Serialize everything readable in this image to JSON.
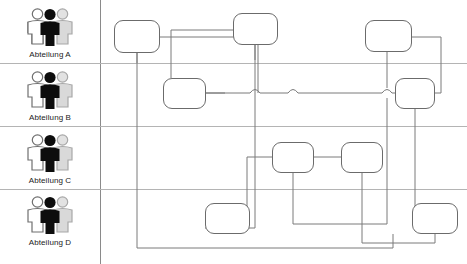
{
  "diagram": {
    "type": "swimlane-flowchart",
    "title": "",
    "canvas": {
      "width": 467,
      "height": 264,
      "background": "#ffffff"
    },
    "header_column": {
      "x": 0,
      "width": 100,
      "divider_x": 100,
      "divider_color": "#8a8a8a"
    },
    "lane_divider_color": "#b4b4b4",
    "node_stroke": "#6b6b6b",
    "node_fill": "#ffffff",
    "wire_color": "#7a7a7a",
    "lanes": [
      {
        "id": "lane-a",
        "label": "Abteilung A",
        "icon": "group-people-icon",
        "top": 0,
        "bottom": 63,
        "icon_y": 6,
        "label_y": 50
      },
      {
        "id": "lane-b",
        "label": "Abteilung B",
        "icon": "group-people-icon",
        "top": 63,
        "bottom": 126,
        "icon_y": 69,
        "label_y": 113
      },
      {
        "id": "lane-c",
        "label": "Abteilung C",
        "icon": "group-people-icon",
        "top": 126,
        "bottom": 189,
        "icon_y": 132,
        "label_y": 176
      },
      {
        "id": "lane-d",
        "label": "Abteilung D",
        "icon": "group-people-icon",
        "top": 189,
        "bottom": 264,
        "icon_y": 194,
        "label_y": 238
      }
    ],
    "lane_dividers_y": [
      63,
      126,
      189
    ],
    "nodes": [
      {
        "id": "n1",
        "lane": "lane-a",
        "label": "",
        "x": 114,
        "y": 20,
        "w": 46,
        "h": 33
      },
      {
        "id": "n2",
        "lane": "lane-a",
        "label": "",
        "x": 233,
        "y": 13,
        "w": 45,
        "h": 32
      },
      {
        "id": "n3",
        "lane": "lane-a",
        "label": "",
        "x": 365,
        "y": 20,
        "w": 47,
        "h": 32
      },
      {
        "id": "n4",
        "lane": "lane-b",
        "label": "",
        "x": 163,
        "y": 78,
        "w": 43,
        "h": 31
      },
      {
        "id": "n5",
        "lane": "lane-b",
        "label": "",
        "x": 395,
        "y": 78,
        "w": 40,
        "h": 31
      },
      {
        "id": "n6",
        "lane": "lane-c",
        "label": "",
        "x": 272,
        "y": 142,
        "w": 42,
        "h": 31
      },
      {
        "id": "n7",
        "lane": "lane-c",
        "label": "",
        "x": 341,
        "y": 142,
        "w": 42,
        "h": 31
      },
      {
        "id": "n8",
        "lane": "lane-d",
        "label": "",
        "x": 205,
        "y": 203,
        "w": 45,
        "h": 31
      },
      {
        "id": "n9",
        "lane": "lane-d",
        "label": "",
        "x": 412,
        "y": 203,
        "w": 46,
        "h": 31
      }
    ],
    "connectors": [
      {
        "id": "c1",
        "from": "n1",
        "to": "n4",
        "path": "M160,37 L258,37 L258,93 L206,93"
      },
      {
        "id": "c2",
        "from": "n1",
        "to": "n8",
        "path": "M137,53 L137,248 L393,248 L393,234"
      },
      {
        "id": "c3",
        "from": "n2",
        "to": "n4",
        "path": "M233,30 L171,30 L171,78"
      },
      {
        "id": "c4",
        "from": "n2",
        "to": "n8",
        "path": "M255,45 L255,228 L205,228"
      },
      {
        "id": "c5",
        "from": "n3",
        "to": "n5",
        "path": "M412,37 L441,37 L441,93 L435,93"
      },
      {
        "id": "c6",
        "from": "n3",
        "to": "n6",
        "path": "M365,36 L387,36 L387,224 L293,224 L293,173"
      },
      {
        "id": "c7",
        "from": "n4",
        "to": "n5",
        "path": "M206,93 L395,93"
      },
      {
        "id": "c8",
        "from": "n5",
        "to": "n9",
        "path": "M415,109 L415,222 L440,222 L440,203"
      },
      {
        "id": "c9",
        "from": "n6",
        "to": "n7",
        "path": "M314,157 L341,157"
      },
      {
        "id": "c10",
        "from": "n7",
        "to": "n9",
        "path": "M362,173 L362,243 L435,243 L435,234"
      },
      {
        "id": "c11",
        "from": "n6",
        "to": "n8",
        "path": "M272,157 L247,157 L247,218 L228,218 L228,203"
      }
    ],
    "line_jumps": [
      {
        "x": 255,
        "y": 93
      },
      {
        "x": 293,
        "y": 93
      },
      {
        "x": 387,
        "y": 93
      }
    ]
  }
}
